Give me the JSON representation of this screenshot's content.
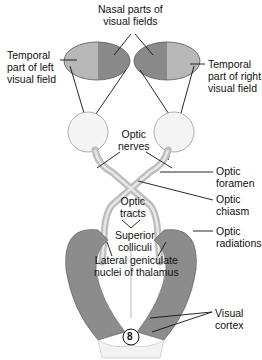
{
  "labels": {
    "nasal": "Nasal parts of\nvisual fields",
    "temporal_left": "Temporal\npart of left\nvisual field",
    "temporal_right": "Temporal\npart of right\nvisual field",
    "optic_nerves": "Optic\nnerves",
    "optic_foramen": "Optic\nforamen",
    "optic_chiasm": "Optic\nchiasm",
    "optic_tracts": "Optic\ntracts",
    "superior_colliculi": "Superior\ncolliculi",
    "optic_radiations": "Optic\nradiations",
    "lateral_geniculate": "Lateral geniculate\nnuclei of thalamus",
    "visual_cortex": "Visual\ncortex",
    "figure_number": "8"
  },
  "colors": {
    "temporal_field": "#b5b5b5",
    "nasal_field": "#8a8a8a",
    "tissue": "#d9d9d9",
    "radiation": "#7a7a7a",
    "line": "#111111"
  }
}
